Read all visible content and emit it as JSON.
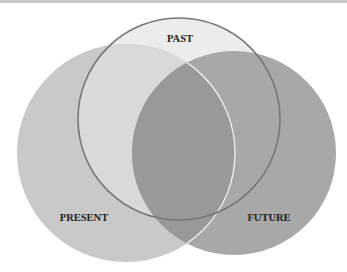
{
  "diagram": {
    "type": "venn",
    "sets": [
      {
        "id": "past",
        "label": "PAST",
        "fill": "#ececec",
        "stroke": "#777777"
      },
      {
        "id": "present",
        "label": "PRESENT",
        "fill": "#c9c9c9"
      },
      {
        "id": "future",
        "label": "FUTURE",
        "fill": "#a8a8a8"
      }
    ]
  }
}
